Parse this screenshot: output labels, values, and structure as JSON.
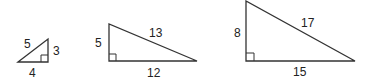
{
  "diagram": {
    "title": "",
    "triangles": [
      {
        "name": "triangle-3-4-5",
        "legs": {
          "vertical": "3",
          "horizontal": "4"
        },
        "hypotenuse": "5",
        "right_angle": "bottom-right"
      },
      {
        "name": "triangle-5-12-13",
        "legs": {
          "vertical": "5",
          "horizontal": "12"
        },
        "hypotenuse": "13",
        "right_angle": "bottom-left"
      },
      {
        "name": "triangle-8-15-17",
        "legs": {
          "vertical": "8",
          "horizontal": "15"
        },
        "hypotenuse": "17",
        "right_angle": "bottom-left"
      }
    ],
    "stroke_color": "#333333"
  }
}
